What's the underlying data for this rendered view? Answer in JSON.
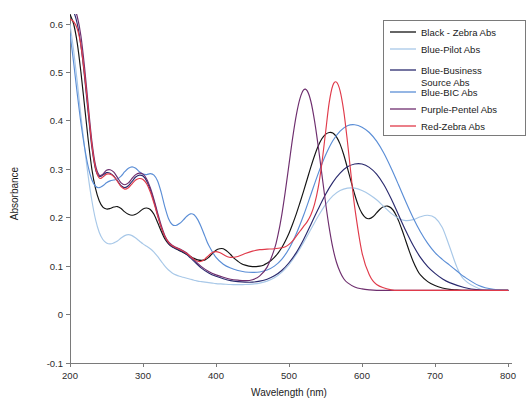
{
  "chart_data": {
    "type": "line",
    "title": "",
    "xlabel": "Wavelength (nm)",
    "ylabel": "Absorbance",
    "xlim": [
      200,
      800
    ],
    "ylim": [
      -0.1,
      0.6
    ],
    "xticks": [
      200,
      300,
      400,
      500,
      600,
      700,
      800
    ],
    "yticks": [
      -0.1,
      0,
      0.1,
      0.2,
      0.3,
      0.4,
      0.5,
      0.6
    ],
    "xtick_labels": [
      "200",
      "300",
      "400",
      "500",
      "600",
      "700",
      "800"
    ],
    "ytick_labels": [
      "-0.1",
      "0",
      "0.1",
      "0.2",
      "0.3",
      "0.4",
      "0.5",
      "0.6"
    ],
    "grid": false,
    "legend_position": "upper right",
    "series": [
      {
        "name": "Black - Zebra Abs",
        "color": "#141414",
        "x": [
          200,
          205,
          210,
          215,
          220,
          225,
          230,
          235,
          240,
          245,
          250,
          255,
          260,
          265,
          270,
          275,
          280,
          285,
          290,
          295,
          300,
          305,
          310,
          315,
          320,
          325,
          330,
          335,
          340,
          345,
          350,
          355,
          360,
          365,
          370,
          375,
          380,
          385,
          390,
          395,
          400,
          405,
          410,
          415,
          420,
          425,
          430,
          435,
          440,
          445,
          450,
          455,
          460,
          465,
          470,
          475,
          480,
          485,
          490,
          495,
          500,
          505,
          510,
          515,
          520,
          525,
          530,
          535,
          540,
          545,
          550,
          555,
          560,
          565,
          570,
          575,
          580,
          585,
          590,
          595,
          600,
          605,
          610,
          615,
          620,
          625,
          630,
          635,
          640,
          645,
          650,
          655,
          660,
          665,
          670,
          675,
          680,
          690,
          700,
          710,
          720,
          730,
          740,
          760,
          780,
          800
        ],
        "y": [
          0.62,
          0.6,
          0.56,
          0.5,
          0.43,
          0.36,
          0.3,
          0.26,
          0.235,
          0.222,
          0.218,
          0.219,
          0.222,
          0.223,
          0.219,
          0.212,
          0.207,
          0.205,
          0.207,
          0.212,
          0.218,
          0.22,
          0.217,
          0.207,
          0.19,
          0.172,
          0.156,
          0.146,
          0.14,
          0.136,
          0.132,
          0.128,
          0.124,
          0.12,
          0.116,
          0.113,
          0.112,
          0.113,
          0.118,
          0.126,
          0.133,
          0.136,
          0.136,
          0.131,
          0.124,
          0.116,
          0.11,
          0.105,
          0.102,
          0.1,
          0.099,
          0.099,
          0.1,
          0.102,
          0.106,
          0.111,
          0.118,
          0.127,
          0.138,
          0.152,
          0.168,
          0.187,
          0.208,
          0.231,
          0.255,
          0.28,
          0.305,
          0.328,
          0.348,
          0.363,
          0.372,
          0.376,
          0.375,
          0.367,
          0.352,
          0.33,
          0.303,
          0.275,
          0.248,
          0.225,
          0.209,
          0.2,
          0.198,
          0.202,
          0.21,
          0.218,
          0.223,
          0.224,
          0.22,
          0.21,
          0.194,
          0.174,
          0.152,
          0.13,
          0.11,
          0.094,
          0.082,
          0.068,
          0.06,
          0.055,
          0.052,
          0.051,
          0.05,
          0.05,
          0.05,
          0.05
        ]
      },
      {
        "name": "Blue-Pilot Abs",
        "color": "#a8c8e8",
        "x": [
          200,
          205,
          210,
          215,
          220,
          225,
          230,
          235,
          240,
          245,
          250,
          255,
          260,
          265,
          270,
          275,
          280,
          285,
          290,
          295,
          300,
          305,
          310,
          315,
          320,
          325,
          330,
          335,
          340,
          345,
          350,
          355,
          360,
          365,
          370,
          375,
          380,
          385,
          390,
          395,
          400,
          410,
          420,
          430,
          440,
          450,
          460,
          470,
          480,
          490,
          500,
          510,
          520,
          530,
          540,
          550,
          560,
          570,
          580,
          590,
          600,
          610,
          620,
          630,
          640,
          650,
          660,
          670,
          680,
          690,
          700,
          710,
          720,
          730,
          740,
          760,
          780,
          800
        ],
        "y": [
          0.6,
          0.545,
          0.48,
          0.41,
          0.345,
          0.285,
          0.235,
          0.196,
          0.17,
          0.155,
          0.148,
          0.146,
          0.148,
          0.152,
          0.158,
          0.163,
          0.165,
          0.163,
          0.158,
          0.152,
          0.146,
          0.141,
          0.136,
          0.129,
          0.12,
          0.11,
          0.1,
          0.092,
          0.086,
          0.082,
          0.079,
          0.077,
          0.075,
          0.073,
          0.071,
          0.069,
          0.068,
          0.067,
          0.066,
          0.065,
          0.064,
          0.063,
          0.062,
          0.062,
          0.062,
          0.063,
          0.065,
          0.069,
          0.076,
          0.087,
          0.103,
          0.124,
          0.149,
          0.176,
          0.203,
          0.227,
          0.245,
          0.256,
          0.261,
          0.261,
          0.256,
          0.248,
          0.237,
          0.223,
          0.209,
          0.199,
          0.194,
          0.196,
          0.202,
          0.205,
          0.2,
          0.18,
          0.14,
          0.098,
          0.072,
          0.054,
          0.05,
          0.05
        ]
      },
      {
        "name": "Blue-Business Source Abs",
        "color": "#2a2a6e",
        "x": [
          200,
          205,
          210,
          215,
          220,
          225,
          230,
          235,
          240,
          245,
          250,
          255,
          260,
          265,
          270,
          275,
          280,
          285,
          290,
          295,
          300,
          305,
          310,
          315,
          320,
          325,
          330,
          335,
          340,
          345,
          350,
          355,
          360,
          365,
          370,
          380,
          390,
          400,
          410,
          420,
          430,
          440,
          450,
          460,
          470,
          480,
          490,
          500,
          510,
          520,
          530,
          540,
          550,
          560,
          570,
          580,
          590,
          600,
          610,
          620,
          630,
          640,
          650,
          660,
          670,
          680,
          690,
          700,
          710,
          720,
          740,
          760,
          780,
          800
        ],
        "y": [
          0.63,
          0.625,
          0.6,
          0.555,
          0.49,
          0.415,
          0.345,
          0.3,
          0.285,
          0.288,
          0.293,
          0.292,
          0.286,
          0.276,
          0.266,
          0.262,
          0.266,
          0.275,
          0.284,
          0.288,
          0.286,
          0.276,
          0.258,
          0.234,
          0.206,
          0.18,
          0.16,
          0.147,
          0.14,
          0.136,
          0.133,
          0.129,
          0.124,
          0.117,
          0.11,
          0.096,
          0.086,
          0.079,
          0.074,
          0.07,
          0.068,
          0.067,
          0.067,
          0.069,
          0.073,
          0.08,
          0.091,
          0.107,
          0.128,
          0.155,
          0.186,
          0.218,
          0.248,
          0.273,
          0.292,
          0.305,
          0.311,
          0.311,
          0.304,
          0.29,
          0.268,
          0.239,
          0.206,
          0.173,
          0.143,
          0.118,
          0.099,
          0.085,
          0.074,
          0.066,
          0.056,
          0.051,
          0.05,
          0.05
        ]
      },
      {
        "name": "Blue-BIC Abs",
        "color": "#5b8ed6",
        "x": [
          200,
          205,
          210,
          215,
          220,
          225,
          230,
          235,
          240,
          245,
          250,
          255,
          260,
          265,
          270,
          275,
          280,
          285,
          290,
          295,
          300,
          305,
          310,
          315,
          320,
          325,
          330,
          335,
          340,
          345,
          350,
          355,
          360,
          365,
          370,
          375,
          380,
          385,
          390,
          400,
          410,
          420,
          430,
          440,
          450,
          460,
          470,
          480,
          490,
          500,
          510,
          520,
          530,
          540,
          550,
          560,
          570,
          580,
          590,
          600,
          610,
          620,
          630,
          640,
          650,
          660,
          670,
          680,
          690,
          700,
          710,
          720,
          730,
          740,
          760,
          780,
          800
        ],
        "y": [
          0.58,
          0.52,
          0.455,
          0.395,
          0.345,
          0.305,
          0.278,
          0.265,
          0.262,
          0.266,
          0.272,
          0.276,
          0.278,
          0.28,
          0.286,
          0.295,
          0.302,
          0.305,
          0.302,
          0.295,
          0.29,
          0.289,
          0.291,
          0.288,
          0.276,
          0.252,
          0.222,
          0.198,
          0.186,
          0.184,
          0.188,
          0.195,
          0.203,
          0.208,
          0.206,
          0.196,
          0.18,
          0.161,
          0.143,
          0.118,
          0.104,
          0.096,
          0.091,
          0.088,
          0.087,
          0.088,
          0.092,
          0.1,
          0.114,
          0.136,
          0.167,
          0.205,
          0.248,
          0.291,
          0.329,
          0.359,
          0.379,
          0.39,
          0.392,
          0.387,
          0.376,
          0.358,
          0.333,
          0.302,
          0.268,
          0.233,
          0.2,
          0.171,
          0.147,
          0.128,
          0.114,
          0.102,
          0.09,
          0.078,
          0.06,
          0.052,
          0.05
        ]
      },
      {
        "name": "Purple-Pentel Abs",
        "color": "#6e2e6e",
        "x": [
          200,
          205,
          210,
          215,
          220,
          225,
          230,
          235,
          240,
          245,
          250,
          255,
          260,
          265,
          270,
          275,
          280,
          285,
          290,
          295,
          300,
          305,
          310,
          315,
          320,
          325,
          330,
          335,
          340,
          345,
          350,
          355,
          360,
          365,
          370,
          380,
          390,
          400,
          410,
          420,
          430,
          440,
          450,
          460,
          470,
          480,
          485,
          490,
          495,
          500,
          505,
          510,
          515,
          520,
          525,
          530,
          535,
          540,
          545,
          550,
          555,
          560,
          565,
          570,
          575,
          580,
          590,
          600,
          610,
          620,
          640,
          660,
          680,
          700,
          730,
          760,
          800
        ],
        "y": [
          0.64,
          0.635,
          0.615,
          0.575,
          0.51,
          0.432,
          0.358,
          0.308,
          0.288,
          0.29,
          0.298,
          0.299,
          0.294,
          0.283,
          0.272,
          0.268,
          0.272,
          0.281,
          0.289,
          0.292,
          0.29,
          0.28,
          0.262,
          0.238,
          0.21,
          0.184,
          0.163,
          0.15,
          0.143,
          0.139,
          0.136,
          0.132,
          0.127,
          0.12,
          0.113,
          0.099,
          0.089,
          0.082,
          0.077,
          0.073,
          0.071,
          0.07,
          0.072,
          0.08,
          0.098,
          0.135,
          0.165,
          0.205,
          0.255,
          0.31,
          0.365,
          0.412,
          0.446,
          0.464,
          0.462,
          0.44,
          0.4,
          0.348,
          0.29,
          0.232,
          0.18,
          0.138,
          0.108,
          0.088,
          0.074,
          0.066,
          0.057,
          0.053,
          0.051,
          0.05,
          0.05,
          0.05,
          0.05,
          0.05,
          0.05,
          0.05,
          0.05
        ]
      },
      {
        "name": "Red-Zebra Abs",
        "color": "#e03a4a",
        "x": [
          200,
          205,
          210,
          215,
          220,
          225,
          230,
          235,
          240,
          245,
          250,
          255,
          260,
          265,
          270,
          275,
          280,
          285,
          290,
          295,
          300,
          305,
          310,
          315,
          320,
          325,
          330,
          335,
          340,
          345,
          350,
          355,
          360,
          365,
          370,
          375,
          380,
          385,
          390,
          395,
          400,
          405,
          410,
          415,
          420,
          430,
          440,
          450,
          460,
          470,
          480,
          490,
          495,
          500,
          505,
          510,
          515,
          520,
          525,
          530,
          535,
          540,
          545,
          550,
          555,
          560,
          565,
          570,
          575,
          580,
          585,
          590,
          600,
          610,
          620,
          640,
          660,
          680,
          700,
          740,
          780,
          800
        ],
        "y": [
          0.61,
          0.605,
          0.59,
          0.555,
          0.495,
          0.422,
          0.35,
          0.302,
          0.282,
          0.284,
          0.29,
          0.29,
          0.285,
          0.275,
          0.264,
          0.259,
          0.262,
          0.27,
          0.278,
          0.281,
          0.279,
          0.27,
          0.253,
          0.23,
          0.204,
          0.18,
          0.161,
          0.149,
          0.142,
          0.138,
          0.135,
          0.131,
          0.126,
          0.12,
          0.114,
          0.11,
          0.11,
          0.115,
          0.122,
          0.128,
          0.13,
          0.128,
          0.124,
          0.12,
          0.118,
          0.12,
          0.126,
          0.131,
          0.134,
          0.135,
          0.136,
          0.138,
          0.14,
          0.145,
          0.152,
          0.162,
          0.172,
          0.182,
          0.192,
          0.206,
          0.228,
          0.262,
          0.312,
          0.375,
          0.437,
          0.473,
          0.48,
          0.462,
          0.42,
          0.358,
          0.288,
          0.222,
          0.128,
          0.082,
          0.062,
          0.051,
          0.05,
          0.05,
          0.05,
          0.05,
          0.05,
          0.05
        ]
      }
    ]
  },
  "legend": {
    "entries": [
      {
        "label": "Black - Zebra Abs",
        "color": "#141414"
      },
      {
        "label": "Blue-Pilot Abs",
        "color": "#a8c8e8"
      },
      {
        "label": "Blue-Business",
        "label2": "Source Abs",
        "color": "#2a2a6e"
      },
      {
        "label": "Blue-BIC Abs",
        "color": "#5b8ed6"
      },
      {
        "label": "Purple-Pentel Abs",
        "color": "#6e2e6e"
      },
      {
        "label": "Red-Zebra Abs",
        "color": "#e03a4a"
      }
    ]
  }
}
